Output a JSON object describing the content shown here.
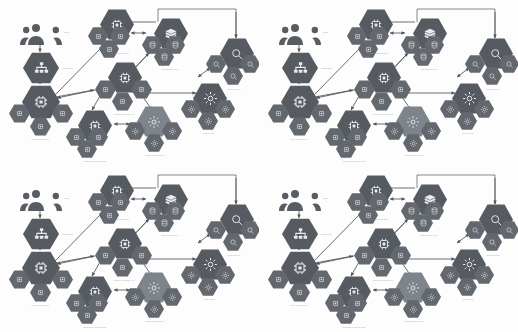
{
  "page": {
    "background_color": "#fdfdfd",
    "width": 518,
    "height": 332,
    "layout": "2x2 repeated tiling of one identical diagram",
    "tile_count": 4
  },
  "palette": {
    "node_fill": "#5a5f66",
    "node_fill_large": "#565b62",
    "node_fill_small": "#63686f",
    "node_highlight": "#7e848c",
    "icon_stroke": "#e9eaec",
    "edge_stroke": "#4e535a",
    "label_text": "#8d9198",
    "actor_fill": "#585d64"
  },
  "diagram": {
    "actor": {
      "icon": "users-group-icon",
      "label": "Users"
    },
    "clusters": [
      {
        "id": "org",
        "icon": "org-chart-icon",
        "label": "Organization",
        "caption": "Organization Unit"
      },
      {
        "id": "core-left",
        "icon": "cpu-chip-icon",
        "caption": "Core Processor Unit",
        "satellites": [
          "chip-icon",
          "chip-icon",
          "chip-icon"
        ]
      },
      {
        "id": "core-top",
        "icon": "cpu-chip-icon",
        "caption": "Primary Compute Node",
        "satellites": [
          "chip-icon",
          "chip-icon",
          "chip-icon"
        ]
      },
      {
        "id": "data-stack",
        "icon": "layers-stack-icon",
        "caption": "Data Storage Layer",
        "satellites": [
          "database-icon",
          "database-icon",
          "database-icon"
        ]
      },
      {
        "id": "core-center",
        "icon": "cpu-chip-icon",
        "caption": "Central Processing Hub",
        "satellites": [
          "chip-icon",
          "chip-icon"
        ]
      },
      {
        "id": "core-bottom",
        "icon": "cpu-chip-icon",
        "caption": "Secondary Compute Node",
        "satellites": [
          "chip-icon",
          "chip-icon",
          "chip-icon"
        ]
      },
      {
        "id": "settings",
        "icon": "gear-icon",
        "caption": "Configuration Service",
        "satellites": [
          "gear-icon",
          "gear-icon",
          "gear-icon"
        ]
      },
      {
        "id": "search",
        "icon": "search-icon",
        "caption": "Search Service",
        "satellites": [
          "search-icon",
          "search-icon",
          "search-icon"
        ]
      },
      {
        "id": "control",
        "icon": "settings-control-icon",
        "caption": "Control Plane",
        "satellites": [
          "gear-icon",
          "gear-icon",
          "gear-icon"
        ]
      }
    ],
    "edge_count": 14,
    "edge_style": "solid arrows, some bidirectional"
  }
}
